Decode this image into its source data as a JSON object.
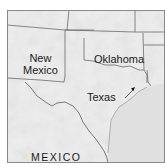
{
  "map": {
    "type": "regional-map",
    "style": "grayscale shaded relief",
    "labels": {
      "new_mexico_line1": "New",
      "new_mexico_line2": "Mexico",
      "oklahoma": "Oklahoma",
      "texas": "Texas",
      "mexico": "MEXICO"
    },
    "regions": [
      "New Mexico",
      "Oklahoma",
      "Texas",
      "MEXICO",
      "Gulf of Mexico"
    ],
    "marker": {
      "type": "arrow",
      "direction": "northeast",
      "location": "east Texas near coast"
    },
    "colors": {
      "land": "#ededed",
      "water": "#e2e2e2",
      "border": "#6b6b6b",
      "frame": "#8a8a8a",
      "text": "#1a1a1a"
    }
  }
}
